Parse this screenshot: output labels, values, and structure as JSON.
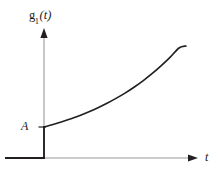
{
  "figure": {
    "caption_alt": "Exponential growth curve starting at amplitude A",
    "background_color": "#ffffff",
    "width": 218,
    "height": 177
  },
  "labels": {
    "y_axis_function": "g",
    "y_axis_subscript": "1",
    "y_axis_argument": "(t)",
    "x_axis": "t",
    "intercept": "A"
  },
  "colors": {
    "curve": "#231f20",
    "axis_light": "#9a9a9a",
    "axis_dark": "#231f20",
    "text": "#1a1a1a"
  },
  "chart_data": {
    "type": "line",
    "title": "",
    "xlabel": "t",
    "ylabel": "g1(t)",
    "grid": false,
    "legend": "none",
    "annotations": [
      {
        "text": "A",
        "x": 0,
        "y": 1,
        "note": "y-intercept of the curve, marked on the vertical axis"
      }
    ],
    "axes": {
      "x": {
        "label": "t",
        "arrow": true,
        "ticks": [],
        "origin_px": 44,
        "extends_left_of_origin": true
      },
      "y": {
        "label": "g1(t)",
        "arrow": true,
        "ticks": [
          "A"
        ],
        "origin_px": 158
      }
    },
    "xlim": [
      -0.45,
      2.05
    ],
    "ylim": [
      0,
      4.6
    ],
    "series": [
      {
        "name": "g1(t)",
        "description": "Rising exponential curve g1(t) = A*exp(k*t) beginning at g1(0) = A",
        "x": [
          0.0,
          0.1,
          0.2,
          0.3,
          0.4,
          0.5,
          0.6,
          0.7,
          0.8,
          0.9,
          1.0,
          1.1,
          1.2,
          1.3,
          1.4,
          1.5,
          1.6
        ],
        "y": [
          1.0,
          1.1,
          1.22,
          1.36,
          1.51,
          1.68,
          1.87,
          2.08,
          2.31,
          2.58,
          2.87,
          3.19,
          3.55,
          3.95,
          4.39,
          4.88,
          5.43
        ],
        "points_px": [
          [
            44,
            127
          ],
          [
            53,
            124.5
          ],
          [
            62,
            121.7
          ],
          [
            71,
            118.7
          ],
          [
            80,
            115.4
          ],
          [
            89,
            111.7
          ],
          [
            98,
            107.7
          ],
          [
            107,
            103.3
          ],
          [
            116,
            98.4
          ],
          [
            125,
            93.1
          ],
          [
            134,
            87.2
          ],
          [
            143,
            80.8
          ],
          [
            152,
            73.7
          ],
          [
            161,
            65.9
          ],
          [
            170,
            57.4
          ],
          [
            179,
            48.0
          ],
          [
            186,
            46.0
          ]
        ]
      }
    ]
  }
}
